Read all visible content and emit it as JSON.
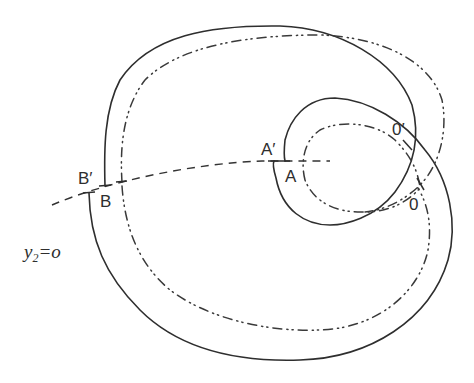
{
  "figure": {
    "type": "geometric diagram",
    "curves": [
      {
        "name": "solid-curve",
        "style": "solid",
        "description": "large spiral-like closed loop from B' around the top, right, looping inward through O' to A'; and from B around the bottom and right to A"
      },
      {
        "name": "dash-dot-curve",
        "style": "dash-dot-dot",
        "description": "inner parallel curve through B-side tick, around top/right, through O to A"
      },
      {
        "name": "section-line",
        "style": "dashed",
        "description": "transversal y2 = 0"
      }
    ],
    "labels": {
      "b_prime": "B′",
      "b": "B",
      "a_prime": "A′",
      "a": "A",
      "o_prime": "0′",
      "o": "0"
    },
    "equation": {
      "var": "y",
      "sub": "2",
      "rhs": "=o"
    }
  }
}
